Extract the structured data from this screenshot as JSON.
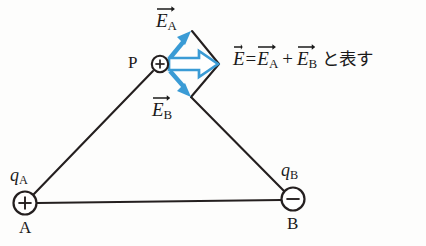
{
  "figure": {
    "kind": "physics-vector-diagram",
    "colors": {
      "vector_blue": "#3a9bd5",
      "vector_blue_dark": "#2a86c4",
      "line_black": "#241f1f",
      "background": "#fdfdfc"
    }
  },
  "points": {
    "P": {
      "label": "P",
      "charge_sign": "+",
      "x": 160,
      "y": 64
    },
    "A": {
      "label": "A",
      "charge_label": "q",
      "charge_sub": "A",
      "charge_sign": "+",
      "x": 25,
      "y": 203
    },
    "B": {
      "label": "B",
      "charge_label": "q",
      "charge_sub": "B",
      "charge_sign": "−",
      "x": 293,
      "y": 199
    }
  },
  "vectors": {
    "EA": {
      "base": "E",
      "sub": "A",
      "label_x": 156,
      "label_y": 4
    },
    "EB": {
      "base": "E",
      "sub": "B",
      "label_x": 152,
      "label_y": 93
    },
    "E": {
      "base": "E",
      "sub": ""
    }
  },
  "equation": {
    "lhs_base": "E",
    "eq_sign": "=",
    "term1_base": "E",
    "term1_sub": "A",
    "plus_sign": "+",
    "term2_base": "E",
    "term2_sub": "B",
    "trailing_text": "と表す"
  }
}
